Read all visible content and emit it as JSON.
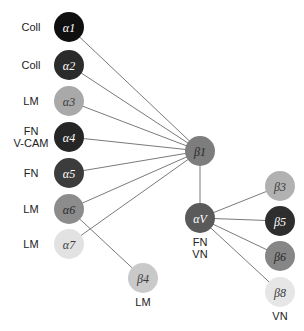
{
  "diagram": {
    "radius": 15,
    "nodes": [
      {
        "id": "a1",
        "label": "α1",
        "x": 69,
        "y": 27,
        "fill": "#0f0f0f",
        "text": "#ffffff",
        "ligands": [
          "Coll"
        ],
        "ligand_pos": "left"
      },
      {
        "id": "a2",
        "label": "α2",
        "x": 69,
        "y": 65,
        "fill": "#2b2b2b",
        "text": "#ffffff",
        "ligands": [
          "Coll"
        ],
        "ligand_pos": "left"
      },
      {
        "id": "a3",
        "label": "α3",
        "x": 69,
        "y": 101,
        "fill": "#a9a9a9",
        "text": "#3a3a3a",
        "ligands": [
          "LM"
        ],
        "ligand_pos": "left"
      },
      {
        "id": "a4",
        "label": "α4",
        "x": 69,
        "y": 137,
        "fill": "#262626",
        "text": "#ffffff",
        "ligands": [
          "FN",
          "V-CAM"
        ],
        "ligand_pos": "left"
      },
      {
        "id": "a5",
        "label": "α5",
        "x": 69,
        "y": 173,
        "fill": "#3c3c3c",
        "text": "#ffffff",
        "ligands": [
          "FN"
        ],
        "ligand_pos": "left"
      },
      {
        "id": "a6",
        "label": "α6",
        "x": 69,
        "y": 209,
        "fill": "#8c8c8c",
        "text": "#2a2a2a",
        "ligands": [
          "LM"
        ],
        "ligand_pos": "left"
      },
      {
        "id": "a7",
        "label": "α7",
        "x": 69,
        "y": 244,
        "fill": "#e2e2e2",
        "text": "#3a3a3a",
        "ligands": [
          "LM"
        ],
        "ligand_pos": "left"
      },
      {
        "id": "b1",
        "label": "β1",
        "x": 200,
        "y": 151,
        "fill": "#7d7d7d",
        "text": "#2a2a2a",
        "ligands": [],
        "ligand_pos": "none"
      },
      {
        "id": "av",
        "label": "αV",
        "x": 200,
        "y": 218,
        "fill": "#5a5a5a",
        "text": "#ffffff",
        "ligands": [
          "FN",
          "VN"
        ],
        "ligand_pos": "below"
      },
      {
        "id": "b4",
        "label": "β4",
        "x": 143,
        "y": 278,
        "fill": "#c9c9c9",
        "text": "#3a3a3a",
        "ligands": [
          "LM"
        ],
        "ligand_pos": "below"
      },
      {
        "id": "b3",
        "label": "β3",
        "x": 280,
        "y": 186,
        "fill": "#b1b1b1",
        "text": "#3a3a3a",
        "ligands": [],
        "ligand_pos": "none"
      },
      {
        "id": "b5",
        "label": "β5",
        "x": 280,
        "y": 221,
        "fill": "#2e2e2e",
        "text": "#ffffff",
        "ligands": [],
        "ligand_pos": "none"
      },
      {
        "id": "b6",
        "label": "β6",
        "x": 280,
        "y": 256,
        "fill": "#868686",
        "text": "#2a2a2a",
        "ligands": [],
        "ligand_pos": "none"
      },
      {
        "id": "b8",
        "label": "β8",
        "x": 280,
        "y": 292,
        "fill": "#e6e6e6",
        "text": "#3a3a3a",
        "ligands": [
          "VN"
        ],
        "ligand_pos": "below"
      }
    ],
    "edges": [
      [
        "a1",
        "b1"
      ],
      [
        "a2",
        "b1"
      ],
      [
        "a3",
        "b1"
      ],
      [
        "a4",
        "b1"
      ],
      [
        "a5",
        "b1"
      ],
      [
        "a6",
        "b1"
      ],
      [
        "a7",
        "b1"
      ],
      [
        "a6",
        "b4"
      ],
      [
        "b1",
        "av"
      ],
      [
        "av",
        "b3"
      ],
      [
        "av",
        "b5"
      ],
      [
        "av",
        "b6"
      ],
      [
        "av",
        "b8"
      ]
    ]
  }
}
